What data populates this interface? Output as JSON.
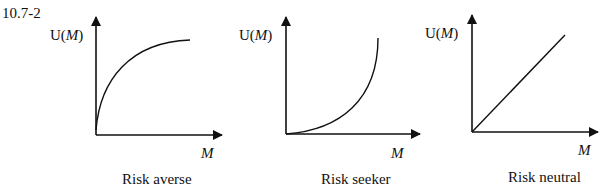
{
  "figure_id": "10.7-2",
  "panels": [
    {
      "ylabel_prefix": "U(",
      "ylabel_var": "M",
      "ylabel_suffix": ")",
      "xlabel": "M",
      "caption": "Risk averse",
      "shape": "concave"
    },
    {
      "ylabel_prefix": "U(",
      "ylabel_var": "M",
      "ylabel_suffix": ")",
      "xlabel": "M",
      "caption": "Risk seeker",
      "shape": "convex"
    },
    {
      "ylabel_prefix": "U(",
      "ylabel_var": "M",
      "ylabel_suffix": ")",
      "xlabel": "M",
      "caption": "Risk neutral",
      "shape": "linear"
    }
  ],
  "colors": {
    "ink": "#111111",
    "background": "#ffffff"
  }
}
